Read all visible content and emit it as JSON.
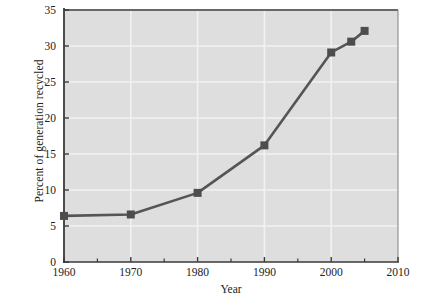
{
  "chart_data": {
    "type": "line",
    "title": "",
    "xlabel": "Year",
    "ylabel": "Percent of generation recycled",
    "x": [
      1960,
      1970,
      1980,
      1990,
      2000,
      2003,
      2005
    ],
    "values": [
      6.4,
      6.6,
      9.6,
      16.2,
      29.1,
      30.6,
      32.1
    ],
    "series": [
      {
        "name": "Percent of generation recycled",
        "values": [
          6.4,
          6.6,
          9.6,
          16.2,
          29.1,
          30.6,
          32.1
        ]
      }
    ],
    "xlim": [
      1960,
      2010
    ],
    "ylim": [
      0,
      35
    ],
    "xticks": [
      1960,
      1970,
      1980,
      1990,
      2000,
      2010
    ],
    "xticklabels": [
      "1960",
      "1970",
      "1980",
      "1990",
      "2000",
      "2010"
    ],
    "xminorticks": [
      1965,
      1975,
      1985,
      1995,
      2005
    ],
    "yticks": [
      0,
      5,
      10,
      15,
      20,
      25,
      30,
      35
    ],
    "yticklabels": [
      "0",
      "5",
      "10",
      "15",
      "20",
      "25",
      "30",
      "35"
    ],
    "grid": true,
    "grid_axis": "both",
    "legend": false,
    "marker": "square",
    "line_color": "#555555",
    "marker_color": "#4d4d4d",
    "plot_background": "#dedede",
    "grid_color": "#f2f2f2",
    "axis_color": "#3a3a3a"
  },
  "axes": {
    "x_title": "Year",
    "y_title": "Percent of generation recycled"
  },
  "artifact": {
    "smudge": ""
  }
}
